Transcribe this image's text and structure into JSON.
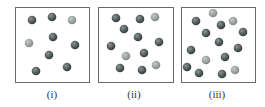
{
  "colors": {
    "dark": "#505a5a",
    "light": "#9aa09c",
    "border": "#6a6a6a"
  },
  "panels": [
    {
      "label": "(i)",
      "box": [
        15,
        7,
        74,
        75
      ],
      "label_x": 52,
      "balls": [
        [
          32,
          20,
          "d"
        ],
        [
          52,
          17,
          "d"
        ],
        [
          72,
          20,
          "l"
        ],
        [
          53,
          37,
          "d"
        ],
        [
          29,
          43,
          "l"
        ],
        [
          75,
          45,
          "d"
        ],
        [
          49,
          55,
          "d"
        ],
        [
          67,
          67,
          "d"
        ],
        [
          36,
          71,
          "d"
        ]
      ]
    },
    {
      "label": "(ii)",
      "box": [
        98,
        7,
        75,
        75
      ],
      "label_x": 134,
      "balls": [
        [
          116,
          18,
          "d"
        ],
        [
          140,
          19,
          "d"
        ],
        [
          155,
          17,
          "l"
        ],
        [
          124,
          29,
          "d"
        ],
        [
          138,
          37,
          "d"
        ],
        [
          111,
          46,
          "d"
        ],
        [
          159,
          42,
          "d"
        ],
        [
          126,
          56,
          "l"
        ],
        [
          144,
          53,
          "d"
        ],
        [
          120,
          68,
          "d"
        ],
        [
          142,
          70,
          "d"
        ],
        [
          156,
          65,
          "l"
        ]
      ]
    },
    {
      "label": "(iii)",
      "box": [
        181,
        7,
        74,
        75
      ],
      "label_x": 217,
      "balls": [
        [
          213,
          13,
          "l"
        ],
        [
          196,
          21,
          "d"
        ],
        [
          221,
          25,
          "d"
        ],
        [
          233,
          21,
          "l"
        ],
        [
          206,
          33,
          "d"
        ],
        [
          243,
          32,
          "d"
        ],
        [
          219,
          42,
          "d"
        ],
        [
          191,
          50,
          "d"
        ],
        [
          238,
          48,
          "d"
        ],
        [
          225,
          57,
          "d"
        ],
        [
          206,
          60,
          "l"
        ],
        [
          187,
          67,
          "d"
        ],
        [
          199,
          73,
          "d"
        ],
        [
          222,
          74,
          "d"
        ],
        [
          235,
          70,
          "l"
        ]
      ]
    }
  ]
}
